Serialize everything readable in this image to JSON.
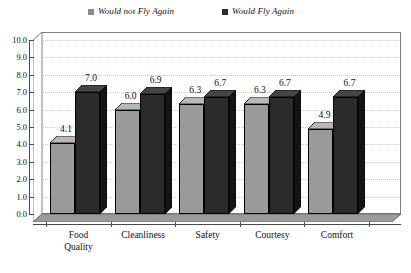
{
  "chart_data": {
    "type": "bar",
    "title": "",
    "subtitle": "",
    "xlabel": "",
    "ylabel": "",
    "ylim": [
      0.0,
      10.0
    ],
    "ytick_step": 1.0,
    "ytick_labels": [
      "10.0",
      "9.0",
      "8.0",
      "7.0",
      "6.0",
      "5.0",
      "4.0",
      "3.0",
      "2.0",
      "1.0",
      "0.0"
    ],
    "ytick_values": [
      10.0,
      9.0,
      8.0,
      7.0,
      6.0,
      5.0,
      4.0,
      3.0,
      2.0,
      1.0,
      0.0
    ],
    "grid": true,
    "grid_axis": "y",
    "grid_style": "dotted",
    "legend_position": "top",
    "three_d": true,
    "categories": [
      "Food\nQuality",
      "Cleanliness",
      "Safety",
      "Courtesy",
      "Comfort"
    ],
    "series": [
      {
        "name": "Would not Fly Again",
        "color": "#9a9a9a",
        "side_color": "#6e6e6e",
        "top_color": "#b8b8b8",
        "values": [
          4.1,
          6.0,
          6.3,
          6.3,
          4.9
        ],
        "value_labels": [
          "4.1",
          "6.0",
          "6.3",
          "6.3",
          "4.9"
        ]
      },
      {
        "name": "Would Fly Again",
        "color": "#2b2b2b",
        "side_color": "#141414",
        "top_color": "#454545",
        "values": [
          7.0,
          6.9,
          6.7,
          6.7,
          6.7
        ],
        "value_labels": [
          "7.0",
          "6.9",
          "6.7",
          "6.7",
          "6.7"
        ]
      }
    ]
  },
  "legend": {
    "entries": [
      {
        "label": "Would not Fly Again",
        "swatch_color": "#8a8a8a"
      },
      {
        "label": "Would Fly Again",
        "swatch_color": "#2b2b2b"
      }
    ]
  },
  "colors": {
    "axis": "#4a4a4a",
    "frame": "#808080",
    "grid": "#c9c9c9",
    "floor": "#9a9a9a",
    "floor_edge": "#6e6e6e",
    "plot_background": "#ffffff",
    "text": "#111111"
  }
}
